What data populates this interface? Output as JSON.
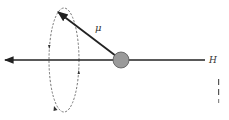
{
  "diagram": {
    "type": "precession-of-magnetic-moment",
    "labels": {
      "moment": "μ",
      "field": "H"
    },
    "colors": {
      "line": "#222222",
      "sphere_fill": "#9a9a9a",
      "sphere_stroke": "#555555",
      "dashed_orbit": "#666666",
      "margin_marks": "#555555"
    },
    "elements": {
      "field_axis": {
        "from": [
          205,
          60
        ],
        "to": [
          3,
          60
        ],
        "arrow": "left"
      },
      "sphere": {
        "cx": 121,
        "cy": 60,
        "r": 8
      },
      "moment_vector": {
        "from": [
          121,
          60
        ],
        "to": [
          57,
          11
        ]
      },
      "precession_orbit": {
        "cx": 64,
        "cy": 60,
        "rx": 15,
        "ry": 52,
        "style": "dashed"
      }
    }
  }
}
